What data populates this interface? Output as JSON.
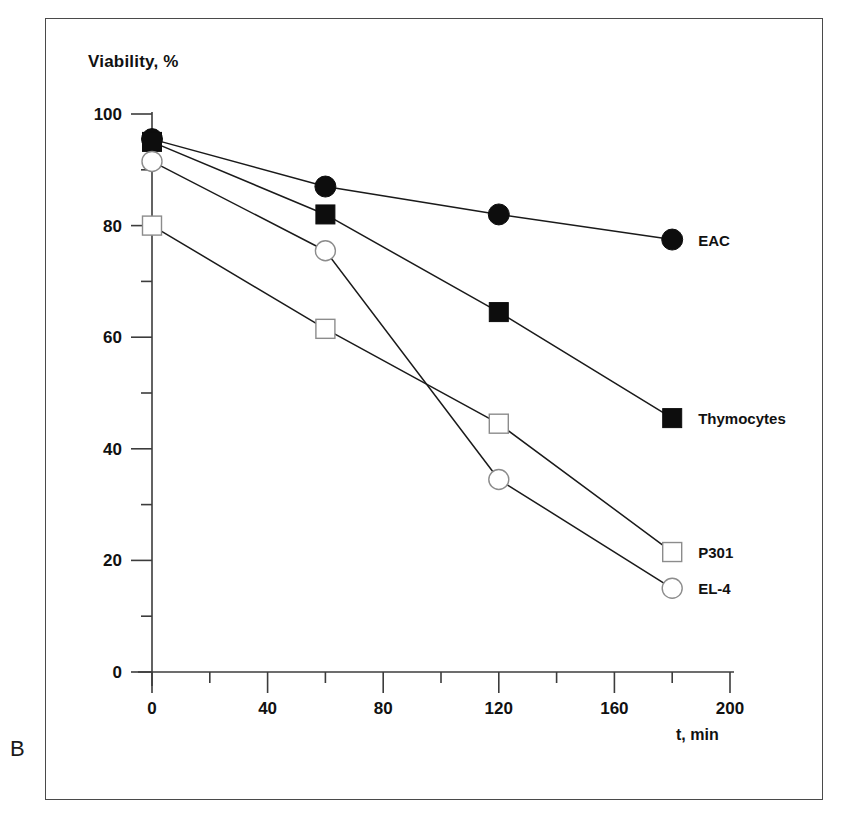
{
  "panel": {
    "letter": "B"
  },
  "chart_data": {
    "type": "line",
    "title": "",
    "subtitle": "",
    "xlabel": "t, min",
    "ylabel": "Viability, %",
    "xlim": [
      0,
      200
    ],
    "ylim": [
      0,
      100
    ],
    "grid": false,
    "legend_position": "right-of-last-point",
    "x": [
      0,
      60,
      120,
      180
    ],
    "x_ticks_major": [
      0,
      40,
      80,
      120,
      160,
      200
    ],
    "x_ticks_minor": [
      20,
      60,
      100,
      140,
      180
    ],
    "x_tick_labels": [
      "0",
      "40",
      "80",
      "120",
      "160",
      "200"
    ],
    "y_ticks_major": [
      0,
      20,
      40,
      60,
      80,
      100
    ],
    "y_ticks_minor": [
      10,
      30,
      50,
      70,
      90
    ],
    "y_tick_labels": [
      "0",
      "20",
      "40",
      "60",
      "80",
      "100"
    ],
    "series": [
      {
        "name": "EAC",
        "marker": "filled-circle",
        "values": [
          95.5,
          87.0,
          82.0,
          77.5
        ],
        "label_x": 200,
        "label_y": 77.5
      },
      {
        "name": "Thymocytes",
        "marker": "filled-square",
        "values": [
          95.0,
          82.0,
          64.5,
          45.5
        ],
        "label_x": 200,
        "label_y": 45.5
      },
      {
        "name": "P301",
        "marker": "open-square",
        "values": [
          80.0,
          61.5,
          44.5,
          21.5
        ],
        "label_x": 200,
        "label_y": 21.5
      },
      {
        "name": "EL-4",
        "marker": "open-circle",
        "values": [
          91.5,
          75.5,
          34.5,
          15.0
        ],
        "label_x": 200,
        "label_y": 15.0
      }
    ]
  },
  "colors": {
    "line": "#1a1a1a",
    "marker_fill": "#0d0d0d",
    "marker_open_fill": "#ffffff",
    "marker_open_stroke": "#8c8c8c",
    "axis": "#3c3c3c",
    "frame": "#4a4a4a",
    "text": "#111111"
  }
}
